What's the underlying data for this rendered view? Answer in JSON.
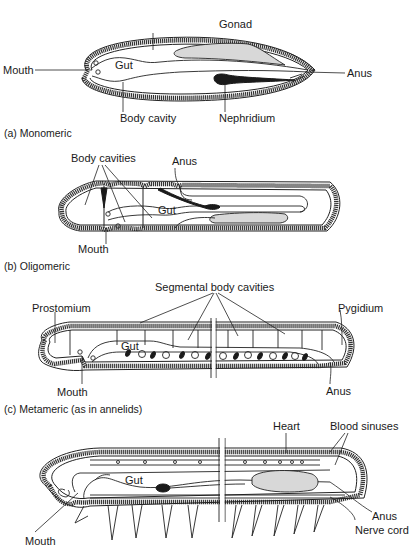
{
  "figure": {
    "panels": [
      {
        "id": "a",
        "caption": "(a) Monomeric",
        "labels": {
          "gonad": "Gonad",
          "mouth": "Mouth",
          "gut": "Gut",
          "anus": "Anus",
          "body_cavity": "Body cavity",
          "nephridium": "Nephridium"
        }
      },
      {
        "id": "b",
        "caption": "(b) Oligomeric",
        "labels": {
          "body_cavities": "Body cavities",
          "anus": "Anus",
          "gut": "Gut",
          "mouth": "Mouth"
        }
      },
      {
        "id": "c",
        "caption": "(c) Metameric (as in annelids)",
        "labels": {
          "segmental_body_cavities": "Segmental body cavities",
          "prostomium": "Prostomium",
          "pygidium": "Pygidium",
          "gut": "Gut",
          "mouth": "Mouth",
          "anus": "Anus"
        }
      },
      {
        "id": "d",
        "caption": "",
        "labels": {
          "heart": "Heart",
          "blood_sinuses": "Blood sinuses",
          "gut": "Gut",
          "anus": "Anus",
          "nerve_cord": "Nerve cord",
          "mouth": "Mouth"
        }
      }
    ]
  }
}
